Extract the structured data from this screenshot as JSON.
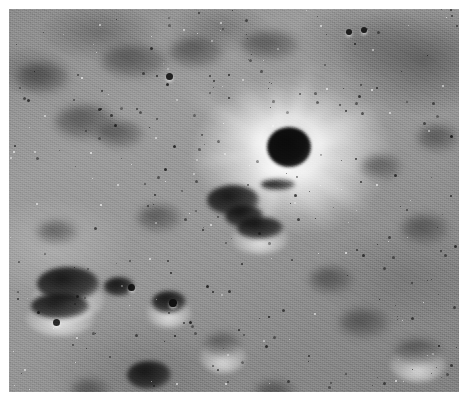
{
  "page": {
    "kind": "photograph",
    "caption": "",
    "canvas": {
      "width": 470,
      "height": 405,
      "background": "#ffffff"
    }
  },
  "photo": {
    "name": "lunar-surface-photograph",
    "alt_text": "Black and white orbital photograph of the Moon's surface showing a bright-rayed impact crater with a dark shadowed floor surrounded by heavily cratered regolith",
    "frame": {
      "x": 9,
      "y": 9,
      "width": 450,
      "height": 383
    },
    "palette": {
      "paper": "#ffffff",
      "regolith_mid": "#909090",
      "regolith_light": "#c8c8c8",
      "regolith_dark": "#5a5a5a",
      "shadow_black": "#0d0d0d",
      "highlight_white": "#f2f2f2"
    },
    "features": {
      "main_crater": {
        "name": "bright-rayed-impact-crater",
        "center_x": 283,
        "center_y": 146,
        "bowl_diameter": 44,
        "bowl_tone": "#0d0d0d",
        "ejecta_radius": 128,
        "description": "dark shadow-filled bowl ringed by a brilliant ejecta halo with radial rays"
      },
      "ray_angles_deg": [
        -96,
        -72,
        -48,
        -26,
        -8,
        12,
        34,
        56,
        78,
        104,
        128,
        152,
        172,
        196,
        214,
        238,
        262
      ],
      "dark_mare_patch": {
        "name": "dark-mare-region",
        "corner": "upper-right",
        "center_x": 414,
        "center_y": 50
      },
      "secondary_craters": [
        {
          "x": 28,
          "y": 258,
          "w": 62,
          "h": 34,
          "rim": true,
          "soft": false
        },
        {
          "x": 22,
          "y": 284,
          "w": 58,
          "h": 26,
          "rim": true,
          "soft": false
        },
        {
          "x": 95,
          "y": 268,
          "w": 30,
          "h": 19,
          "rim": false,
          "soft": false
        },
        {
          "x": 143,
          "y": 282,
          "w": 34,
          "h": 22,
          "rim": true,
          "soft": false
        },
        {
          "x": 118,
          "y": 352,
          "w": 44,
          "h": 28,
          "rim": false,
          "soft": false
        },
        {
          "x": 62,
          "y": 370,
          "w": 38,
          "h": 24,
          "rim": false,
          "soft": true
        },
        {
          "x": 198,
          "y": 176,
          "w": 52,
          "h": 30,
          "rim": false,
          "soft": false
        },
        {
          "x": 216,
          "y": 196,
          "w": 38,
          "h": 22,
          "rim": false,
          "soft": false
        },
        {
          "x": 228,
          "y": 208,
          "w": 46,
          "h": 22,
          "rim": true,
          "soft": false
        },
        {
          "x": 252,
          "y": 170,
          "w": 34,
          "h": 11,
          "rim": false,
          "soft": false
        },
        {
          "x": 46,
          "y": 96,
          "w": 60,
          "h": 34,
          "rim": false,
          "soft": true
        },
        {
          "x": 92,
          "y": 36,
          "w": 66,
          "h": 32,
          "rim": false,
          "soft": true
        },
        {
          "x": 160,
          "y": 28,
          "w": 54,
          "h": 30,
          "rim": false,
          "soft": true
        },
        {
          "x": 232,
          "y": 22,
          "w": 58,
          "h": 28,
          "rim": false,
          "soft": true
        },
        {
          "x": 8,
          "y": 54,
          "w": 52,
          "h": 30,
          "rim": false,
          "soft": true
        },
        {
          "x": 88,
          "y": 112,
          "w": 46,
          "h": 26,
          "rim": false,
          "soft": true
        },
        {
          "x": 128,
          "y": 196,
          "w": 44,
          "h": 26,
          "rim": false,
          "soft": true
        },
        {
          "x": 28,
          "y": 212,
          "w": 40,
          "h": 22,
          "rim": false,
          "soft": true
        },
        {
          "x": 300,
          "y": 258,
          "w": 44,
          "h": 26,
          "rim": false,
          "soft": true
        },
        {
          "x": 330,
          "y": 300,
          "w": 50,
          "h": 28,
          "rim": false,
          "soft": true
        },
        {
          "x": 386,
          "y": 330,
          "w": 46,
          "h": 26,
          "rim": true,
          "soft": true
        },
        {
          "x": 392,
          "y": 206,
          "w": 48,
          "h": 28,
          "rim": false,
          "soft": true
        },
        {
          "x": 352,
          "y": 146,
          "w": 40,
          "h": 24,
          "rim": false,
          "soft": true
        },
        {
          "x": 196,
          "y": 324,
          "w": 36,
          "h": 24,
          "rim": true,
          "soft": true
        },
        {
          "x": 246,
          "y": 372,
          "w": 40,
          "h": 22,
          "rim": false,
          "soft": true
        },
        {
          "x": 408,
          "y": 116,
          "w": 42,
          "h": 26,
          "rim": false,
          "soft": true
        }
      ],
      "notable_pits": [
        {
          "x": 157,
          "y": 64,
          "d": 7
        },
        {
          "x": 337,
          "y": 20,
          "d": 6
        },
        {
          "x": 352,
          "y": 18,
          "d": 6
        },
        {
          "x": 44,
          "y": 310,
          "d": 7
        },
        {
          "x": 160,
          "y": 290,
          "d": 8
        },
        {
          "x": 119,
          "y": 275,
          "d": 7
        }
      ],
      "pit_count_estimate": 210,
      "speck_count_estimate": 95
    }
  }
}
